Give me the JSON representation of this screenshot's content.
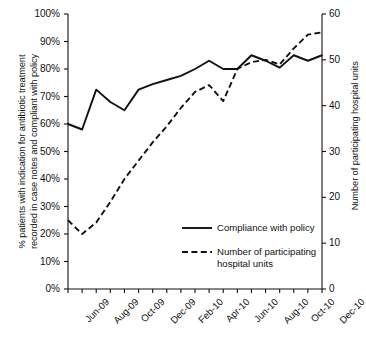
{
  "chart_data": {
    "type": "line",
    "title": "",
    "xlabel": "",
    "ylabel": "% patients with indication for antibiotic treatment recorded in case notes and compliant with policy",
    "y2label": "Number of participating hospital units",
    "grid": false,
    "legend_position": "center-right-inside",
    "ylim": [
      0,
      100
    ],
    "y2lim": [
      0,
      60
    ],
    "ytick_labels": [
      "0%",
      "10%",
      "20%",
      "30%",
      "40%",
      "50%",
      "60%",
      "70%",
      "80%",
      "90%",
      "100%"
    ],
    "ytick_values": [
      0,
      10,
      20,
      30,
      40,
      50,
      60,
      70,
      80,
      90,
      100
    ],
    "y2tick_labels": [
      "0",
      "10",
      "20",
      "30",
      "40",
      "50",
      "60"
    ],
    "y2tick_values": [
      0,
      10,
      20,
      30,
      40,
      50,
      60
    ],
    "xtick_labels": [
      "Jun-09",
      "Aug-09",
      "Oct-09",
      "Dec-09",
      "Feb-10",
      "Apr-10",
      "Jun-10",
      "Aug-10",
      "Oct-10",
      "Dec-10"
    ],
    "x": [
      "Jun-09",
      "Jul-09",
      "Aug-09",
      "Sep-09",
      "Oct-09",
      "Nov-09",
      "Dec-09",
      "Jan-10",
      "Feb-10",
      "Mar-10",
      "Apr-10",
      "May-10",
      "Jun-10",
      "Jul-10",
      "Aug-10",
      "Sep-10",
      "Oct-10",
      "Nov-10",
      "Dec-10"
    ],
    "series": [
      {
        "name": "Compliance with policy",
        "axis": "left",
        "style": "solid",
        "color": "#111111",
        "unit": "%",
        "values": [
          60,
          58,
          72.5,
          68,
          65,
          72.5,
          74.5,
          76,
          77.5,
          80,
          83,
          80,
          80,
          85,
          83,
          80.5,
          85,
          83,
          85
        ]
      },
      {
        "name": "Number of participating hospital units",
        "axis": "right",
        "style": "dashed",
        "color": "#111111",
        "unit": "units",
        "values": [
          15,
          12,
          14.5,
          19,
          24,
          28,
          32,
          35.5,
          39.5,
          43,
          44.5,
          41,
          48,
          49.5,
          50,
          49,
          52.5,
          55.5,
          56
        ]
      }
    ]
  },
  "legend": {
    "items": [
      {
        "label": "Compliance with policy",
        "style": "solid"
      },
      {
        "label_line1": "Number of participating",
        "label_line2": "hospital units",
        "style": "dashed"
      }
    ]
  },
  "axis_titles": {
    "left_line1": "% patients with indication for antibiotic treatment",
    "left_line2": "recorded in case notes and compliant with policy",
    "right": "Number of participating hospital units"
  }
}
